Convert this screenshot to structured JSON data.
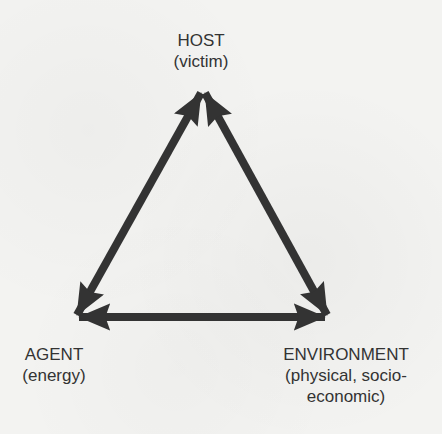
{
  "diagram": {
    "type": "epidemiological-triangle",
    "arrow_color": "#333333",
    "background_color": "#f3f3f1",
    "nodes": {
      "host": {
        "title": "HOST",
        "subtitle": "(victim)"
      },
      "agent": {
        "title": "AGENT",
        "subtitle": "(energy)"
      },
      "environment": {
        "title": "ENVIRONMENT",
        "subtitle_line1": "(physical, socio-",
        "subtitle_line2": "economic)"
      }
    },
    "edges": [
      {
        "from": "host",
        "to": "agent",
        "style": "double-headed-arrow"
      },
      {
        "from": "host",
        "to": "environment",
        "style": "double-headed-arrow"
      },
      {
        "from": "agent",
        "to": "environment",
        "style": "double-headed-arrow"
      }
    ]
  }
}
